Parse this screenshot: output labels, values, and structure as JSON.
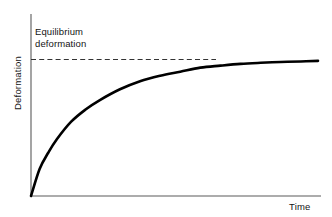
{
  "chart_data": {
    "type": "line",
    "title": "",
    "subtitle": "",
    "xlabel": "Time",
    "ylabel": "Deformation",
    "xlim": [
      0,
      1
    ],
    "ylim": [
      0,
      1.12
    ],
    "grid": false,
    "legend": null,
    "axis_ticks": {
      "x": [],
      "y": []
    },
    "annotations": [
      {
        "name": "equilibrium-deformation-label",
        "lines": [
          "Equilibrium",
          "deformation"
        ],
        "text": "Equilibrium deformation",
        "points_to": "equilibrium-level-line"
      }
    ],
    "reference_lines": [
      {
        "name": "equilibrium-level-line",
        "orientation": "horizontal",
        "value": 1.0,
        "style": "dashed",
        "color": "#333333",
        "label": "Equilibrium deformation"
      }
    ],
    "series": [
      {
        "name": "deformation",
        "style": "solid",
        "color": "#000000",
        "width": 2.6,
        "description": "Creep curve rising steeply from origin then asymptotically approaching the equilibrium deformation level",
        "x": [
          0.0,
          0.03,
          0.06,
          0.09,
          0.14,
          0.19,
          0.24,
          0.31,
          0.38,
          0.45,
          0.52,
          0.59,
          0.66,
          0.73,
          0.8,
          0.87,
          0.94,
          1.0
        ],
        "y": [
          0.0,
          0.2,
          0.32,
          0.42,
          0.55,
          0.64,
          0.71,
          0.79,
          0.85,
          0.89,
          0.92,
          0.95,
          0.965,
          0.978,
          0.986,
          0.992,
          0.996,
          1.0
        ]
      }
    ],
    "colors": {
      "curve": "#000000",
      "axis": "#5a5a5a",
      "dashed_reference": "#333333",
      "text": "#141414",
      "background": "#ffffff"
    }
  },
  "axes": {
    "y_title": "Deformation",
    "x_title": "Time"
  },
  "annotation": {
    "line1": "Equilibrium",
    "line2": "deformation"
  }
}
